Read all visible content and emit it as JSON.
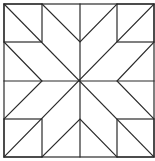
{
  "diagram": {
    "type": "quilt-block",
    "pattern": "eight-point star",
    "title": "",
    "colors": {
      "background": "#ffffff",
      "line": "#2a2a2a"
    },
    "grid": {
      "columns": 4,
      "rows": 4,
      "x": [
        4,
        42,
        80,
        117,
        154
      ],
      "y": [
        4,
        42,
        81,
        119,
        157
      ]
    },
    "shapes": {
      "outer_square": {
        "x1": 4,
        "y1": 4,
        "x2": 154,
        "y2": 157
      },
      "corner_squares": [
        {
          "name": "top-left",
          "x1": 4,
          "y1": 4,
          "x2": 42,
          "y2": 42
        },
        {
          "name": "top-right",
          "x1": 117,
          "y1": 4,
          "x2": 154,
          "y2": 42
        },
        {
          "name": "bottom-left",
          "x1": 4,
          "y1": 119,
          "x2": 42,
          "y2": 157
        },
        {
          "name": "bottom-right",
          "x1": 117,
          "y1": 119,
          "x2": 154,
          "y2": 157
        }
      ],
      "lines": [
        {
          "name": "main-diagonal",
          "x1": 4,
          "y1": 4,
          "x2": 154,
          "y2": 157
        },
        {
          "name": "anti-diagonal",
          "x1": 154,
          "y1": 4,
          "x2": 4,
          "y2": 157
        },
        {
          "name": "center-vertical",
          "x1": 80,
          "y1": 4,
          "x2": 80,
          "y2": 157
        },
        {
          "name": "center-horizontal",
          "x1": 4,
          "y1": 81,
          "x2": 154,
          "y2": 81
        }
      ],
      "chevrons": [
        {
          "name": "top-chevron",
          "points": "42,4 80,42 117,4"
        },
        {
          "name": "bottom-chevron",
          "points": "42,157 80,119 117,157"
        },
        {
          "name": "left-chevron",
          "points": "4,42 42,81 4,119"
        },
        {
          "name": "right-chevron",
          "points": "154,42 117,81 154,119"
        }
      ]
    }
  }
}
